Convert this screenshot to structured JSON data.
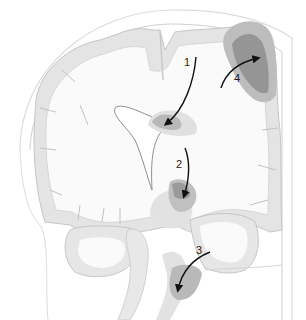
{
  "diagram": {
    "type": "coronal brain section with herniation arrows",
    "labels": [
      {
        "id": "1",
        "text": "1",
        "x": 131,
        "y": 65
      },
      {
        "id": "2",
        "text": "2",
        "x": 176,
        "y": 168
      },
      {
        "id": "3",
        "text": "3",
        "x": 196,
        "y": 254
      },
      {
        "id": "4",
        "text": "4",
        "x": 234,
        "y": 82
      }
    ],
    "colors": {
      "background": "#ffffff",
      "cortex_gray": "#e4e4e4",
      "white_matter": "#fafafa",
      "outline": "#bdbdbd",
      "lesion_dark": "#999999",
      "lesion_mid": "#b5b5b5",
      "arrow": "#111111",
      "skull_line": "#d8d8d8"
    }
  }
}
